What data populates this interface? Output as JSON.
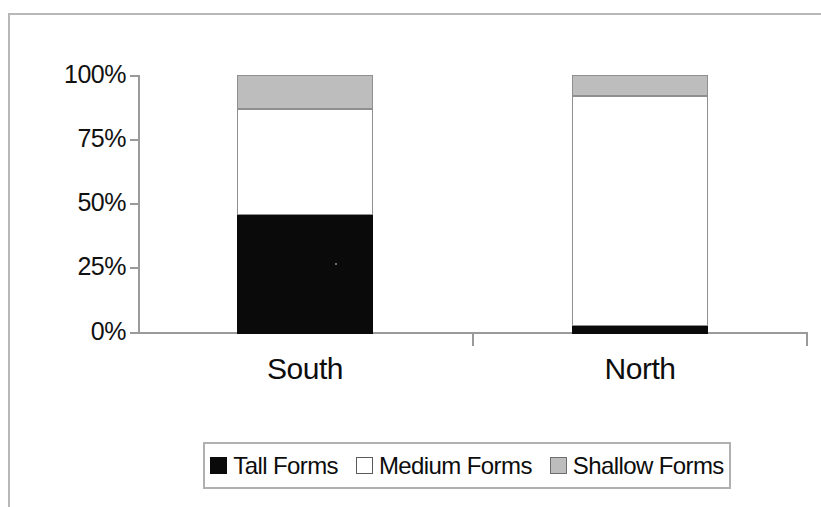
{
  "chart_data": {
    "type": "bar",
    "subtype": "stacked-100-percent",
    "title": "",
    "subtitle": "",
    "xlabel": "",
    "ylabel": "",
    "categories": [
      "South",
      "North"
    ],
    "series": [
      {
        "name": "Tall Forms",
        "values": [
          46,
          3
        ],
        "color": "#000000"
      },
      {
        "name": "Medium Forms",
        "values": [
          41,
          89
        ],
        "color": "#ffffff"
      },
      {
        "name": "Shallow Forms",
        "values": [
          13,
          8
        ],
        "color": "#bdbdbd"
      }
    ],
    "ylim": [
      0,
      100
    ],
    "yticks": [
      0,
      25,
      50,
      75,
      100
    ],
    "ytick_labels": [
      "0%",
      "25%",
      "50%",
      "75%",
      "100%"
    ],
    "grid": false,
    "legend_position": "bottom",
    "stack_order_bottom_to_top": [
      "Tall Forms",
      "Medium Forms",
      "Shallow Forms"
    ]
  },
  "axis": {
    "y_labels": [
      "100%",
      "75%",
      "50%",
      "25%",
      "0%"
    ],
    "y_label_100": "100%",
    "y_label_75": "75%",
    "y_label_50": "50%",
    "y_label_25": "25%",
    "y_label_0": "0%"
  },
  "categories": {
    "south": "South",
    "north": "North"
  },
  "legend": {
    "items": [
      {
        "label": "Tall Forms",
        "swatch": "black-square-icon"
      },
      {
        "label": "Medium Forms",
        "swatch": "white-square-icon"
      },
      {
        "label": "Shallow Forms",
        "swatch": "gray-square-icon"
      }
    ],
    "item_0_label": "Tall Forms",
    "item_1_label": "Medium Forms",
    "item_2_label": "Shallow Forms"
  },
  "colors": {
    "tall": "#000000",
    "medium": "#ffffff",
    "shallow": "#bdbdbd",
    "axis": "#9a9a9a",
    "frame": "#b8b8b8",
    "text": "#0d0d0d"
  }
}
